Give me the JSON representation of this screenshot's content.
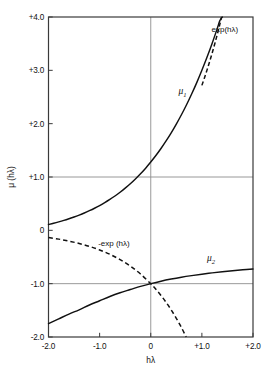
{
  "chart_data": {
    "type": "line",
    "title": "",
    "xlabel": "hλ",
    "ylabel": "μ (hλ)",
    "xlim": [
      -2.0,
      2.0
    ],
    "ylim": [
      -2.0,
      4.0
    ],
    "grid": true,
    "grid_lines": {
      "vertical_at_x": [
        0.0
      ],
      "horizontal_at_y": [
        1.0,
        -1.0
      ]
    },
    "legend_position": "inline-annotations",
    "xticks": [
      -2.0,
      -1.0,
      0.0,
      1.0,
      2.0
    ],
    "xticklabels": [
      "-2.0",
      "-1.0",
      "0",
      "+1.0",
      "+2.0"
    ],
    "yticks": [
      -2.0,
      -1.0,
      0.0,
      1.0,
      2.0,
      3.0,
      4.0
    ],
    "yticklabels": [
      "-2.0",
      "-1.0",
      "0",
      "+1.0",
      "+2.0",
      "+3.0",
      "+4.0"
    ],
    "series": [
      {
        "name": "μ1",
        "label": "μ",
        "subscript": "1",
        "style": "solid",
        "color": "#111111",
        "x": [
          -2.0,
          -1.9,
          -1.8,
          -1.7,
          -1.6,
          -1.5,
          -1.4,
          -1.3,
          -1.2,
          -1.1,
          -1.0,
          -0.9,
          -0.8,
          -0.7,
          -0.6,
          -0.5,
          -0.4,
          -0.3,
          -0.2,
          -0.1,
          0.0,
          0.1,
          0.2,
          0.3,
          0.4,
          0.5,
          0.6,
          0.7,
          0.8,
          0.9,
          1.0,
          1.1,
          1.2,
          1.3,
          1.35,
          1.4
        ],
        "y": [
          0.108,
          0.132,
          0.158,
          0.186,
          0.217,
          0.25,
          0.286,
          0.325,
          0.368,
          0.414,
          0.464,
          0.519,
          0.579,
          0.644,
          0.715,
          0.791,
          0.874,
          0.964,
          1.061,
          1.166,
          1.28,
          1.402,
          1.534,
          1.676,
          1.828,
          1.992,
          2.167,
          2.355,
          2.556,
          2.77,
          3.0,
          3.244,
          3.504,
          3.782,
          3.928,
          4.0
        ]
      },
      {
        "name": "exp(hλ)",
        "label": "exp(hλ)",
        "style": "dashed",
        "color": "#111111",
        "x": [
          1.0,
          1.05,
          1.1,
          1.15,
          1.2,
          1.25,
          1.3,
          1.35,
          1.386
        ],
        "y": [
          2.718,
          2.858,
          3.004,
          3.158,
          3.32,
          3.49,
          3.669,
          3.857,
          4.0
        ]
      },
      {
        "name": "μ2",
        "label": "μ",
        "subscript": "2",
        "style": "solid",
        "color": "#111111",
        "x": [
          -2.0,
          -1.8,
          -1.6,
          -1.4,
          -1.2,
          -1.0,
          -0.8,
          -0.6,
          -0.4,
          -0.2,
          0.0,
          0.2,
          0.4,
          0.6,
          0.8,
          1.0,
          1.2,
          1.4,
          1.6,
          1.8,
          2.0
        ],
        "y": [
          -1.75,
          -1.66,
          -1.57,
          -1.49,
          -1.4,
          -1.32,
          -1.24,
          -1.17,
          -1.11,
          -1.05,
          -1.0,
          -0.954,
          -0.914,
          -0.879,
          -0.849,
          -0.822,
          -0.798,
          -0.777,
          -0.758,
          -0.74,
          -0.724
        ]
      },
      {
        "name": "-exp(hλ)",
        "label": "-exp(hλ)",
        "style": "dashed",
        "color": "#111111",
        "x": [
          -2.0,
          -1.8,
          -1.6,
          -1.4,
          -1.2,
          -1.0,
          -0.8,
          -0.6,
          -0.4,
          -0.2,
          0.0,
          0.1,
          0.2,
          0.3,
          0.4,
          0.5,
          0.6,
          0.693
        ],
        "y": [
          -0.135,
          -0.165,
          -0.202,
          -0.247,
          -0.301,
          -0.368,
          -0.449,
          -0.549,
          -0.67,
          -0.819,
          -1.0,
          -1.105,
          -1.221,
          -1.35,
          -1.492,
          -1.649,
          -1.822,
          -2.0
        ]
      }
    ],
    "annotations": [
      {
        "id": "mu1-annotation",
        "text": "μ",
        "sub": "1",
        "x": 0.62,
        "y": 2.55
      },
      {
        "id": "exp-annotation",
        "text": "exp(hλ)",
        "x": 1.45,
        "y": 3.72
      },
      {
        "id": "mu2-annotation",
        "text": "μ",
        "sub": "2",
        "x": 1.18,
        "y": -0.58
      },
      {
        "id": "neg-exp-annotation",
        "text": "-exp (hλ)",
        "x": -0.72,
        "y": -0.29
      }
    ]
  },
  "axes": {
    "x_title": "hλ",
    "y_title": "μ (hλ)",
    "x_tick_labels": [
      "-2.0",
      "-1.0",
      "0",
      "+1.0",
      "+2.0"
    ],
    "y_tick_labels": [
      "+4.0",
      "+3.0",
      "+2.0",
      "+1.0",
      "0",
      "-1.0",
      "-2.0"
    ]
  },
  "colors": {
    "curve": "#111111",
    "frame": "#3a3a3a",
    "grid": "#8d8d8d",
    "background": "#ffffff"
  }
}
